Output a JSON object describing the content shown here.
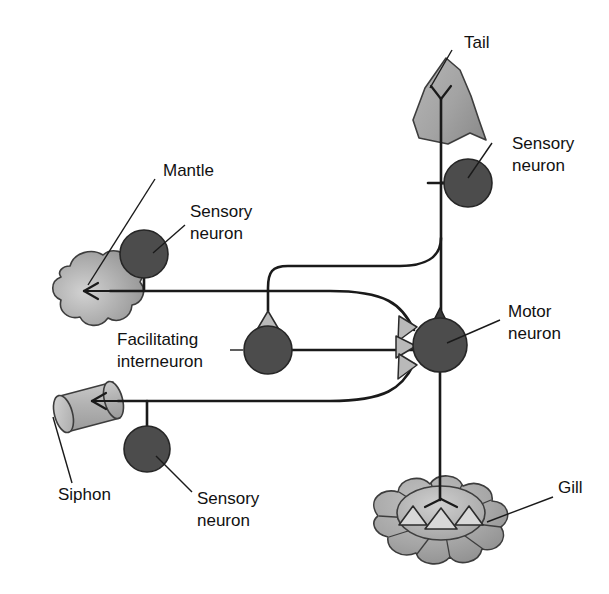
{
  "diagram": {
    "background_color": "#ffffff",
    "ink_color": "#1a1a1a",
    "soma_color": "#4c4c4c",
    "synapse_excitatory_color": "#b9b9b9",
    "synapse_dark_color": "#3a3a3a",
    "organ_fill_color": "#a9a9a9"
  },
  "labels": {
    "tail": "Tail",
    "tail_sensory_neuron": "Sensory\nneuron",
    "tail_sensory_neuron_line1": "Sensory",
    "tail_sensory_neuron_line2": "neuron",
    "mantle": "Mantle",
    "mantle_sensory_neuron_line1": "Sensory",
    "mantle_sensory_neuron_line2": "neuron",
    "facilitating_interneuron_line1": "Facilitating",
    "facilitating_interneuron_line2": "interneuron",
    "motor_neuron_line1": "Motor",
    "motor_neuron_line2": "neuron",
    "siphon": "Siphon",
    "siphon_sensory_neuron_line1": "Sensory",
    "siphon_sensory_neuron_line2": "neuron",
    "gill": "Gill"
  },
  "organs": [
    {
      "id": "tail",
      "name": "Tail",
      "shape": "triangular-fin",
      "fill": "#a9a9a9"
    },
    {
      "id": "mantle",
      "name": "Mantle",
      "shape": "amoeboid-blob",
      "fill": "#a9a9a9"
    },
    {
      "id": "siphon",
      "name": "Siphon",
      "shape": "tilted-cylinder",
      "fill": "#b4b4b4"
    },
    {
      "id": "gill",
      "name": "Gill",
      "shape": "lobed-disc",
      "fill": "#a9a9a9"
    }
  ],
  "neurons": [
    {
      "id": "tail-sensory",
      "type": "sensory",
      "label": "Sensory neuron",
      "cx": 468,
      "cy": 183,
      "r": 24
    },
    {
      "id": "mantle-sensory",
      "type": "sensory",
      "label": "Sensory neuron",
      "cx": 144,
      "cy": 254,
      "r": 24
    },
    {
      "id": "siphon-sensory",
      "type": "sensory",
      "label": "Sensory neuron",
      "cx": 147,
      "cy": 449,
      "r": 23
    },
    {
      "id": "facilitating-interneuron",
      "type": "interneuron",
      "label": "Facilitating interneuron",
      "cx": 268,
      "cy": 350,
      "r": 24
    },
    {
      "id": "motor",
      "type": "motor",
      "label": "Motor neuron",
      "cx": 440,
      "cy": 345,
      "r": 27
    }
  ],
  "synapses": [
    {
      "id": "syn-onto-interneuron",
      "from": "tail-sensory",
      "to": "facilitating-interneuron",
      "style": "light-triangle"
    },
    {
      "id": "syn-tail-onto-motor",
      "from": "tail-sensory",
      "to": "motor",
      "style": "dark-triangle"
    },
    {
      "id": "syn-mantle-onto-motor",
      "from": "mantle-sensory",
      "to": "motor",
      "style": "light-triangle"
    },
    {
      "id": "syn-interneuron-onto-motor",
      "from": "facilitating-interneuron",
      "to": "motor",
      "style": "light-triangle"
    },
    {
      "id": "syn-siphon-onto-motor",
      "from": "siphon-sensory",
      "to": "motor",
      "style": "light-triangle"
    }
  ],
  "connections": [
    {
      "id": "tail-to-sensory",
      "from": "tail",
      "to": "tail-sensory"
    },
    {
      "id": "mantle-to-sensory",
      "from": "mantle",
      "to": "mantle-sensory"
    },
    {
      "id": "siphon-to-sensory",
      "from": "siphon",
      "to": "siphon-sensory"
    },
    {
      "id": "motor-to-gill",
      "from": "motor",
      "to": "gill"
    }
  ]
}
